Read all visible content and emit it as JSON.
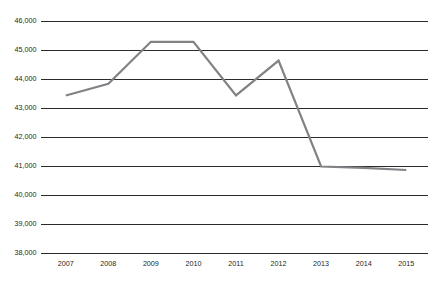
{
  "chart_data": {
    "type": "line",
    "title": "",
    "subtitle": "",
    "xlabel": "",
    "ylabel": "",
    "categories": [
      "2007",
      "2008",
      "2009",
      "2010",
      "2011",
      "2012",
      "2013",
      "2014",
      "2015"
    ],
    "values": [
      43450,
      43850,
      45300,
      45300,
      43450,
      44650,
      41000,
      40950,
      40880
    ],
    "series": [
      {
        "name": "",
        "values": [
          43450,
          43850,
          45300,
          45300,
          43450,
          44650,
          41000,
          40950,
          40880
        ],
        "color": "#808285"
      }
    ],
    "ylim": [
      38000,
      46000
    ],
    "ytick_values": [
      46000,
      45000,
      44000,
      43000,
      42000,
      41000,
      40000,
      39000,
      38000
    ],
    "ytick_labels": [
      "46,000",
      "45,000",
      "44,000",
      "43,000",
      "42,000",
      "41,000",
      "40,000",
      "39,000",
      "38,000"
    ],
    "xtick_labels": [
      "2007",
      "2008",
      "2009",
      "2010",
      "2011",
      "2012",
      "2013",
      "2014",
      "2015"
    ],
    "grid": "horizontal",
    "legend": "none",
    "annotations": [],
    "colors": {
      "line": "#808285",
      "grid": "#2b2b2b",
      "text": "#231f20",
      "background": "#ffffff"
    }
  }
}
